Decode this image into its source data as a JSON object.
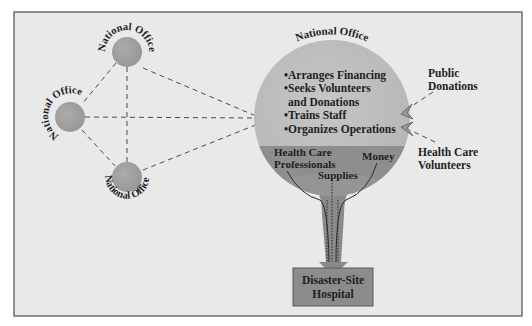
{
  "diagram": {
    "colors": {
      "background": "#e9e9e9",
      "frame": "#6e6e6e",
      "office_circle": "#a3a3a3",
      "central_circle": "#bdbdbd",
      "central_band": "#8e8e8e",
      "funnel": "#8a8a8a",
      "hospital_box": "#8c8c8c",
      "dash_line": "#4a4a4a",
      "text": "#1e1e1e"
    },
    "regional_offices": [
      {
        "label": "National Office",
        "position": "top"
      },
      {
        "label": "National Office",
        "position": "left"
      },
      {
        "label": "National Office",
        "position": "bottom"
      }
    ],
    "central_office": {
      "label": "National Office",
      "functions": [
        "•Arranges Financing",
        "•Seeks Volunteers",
        " and Donations",
        "•Trains Staff",
        "•Organizes Operations"
      ]
    },
    "resources": {
      "professionals_line1": "Health Care",
      "professionals_line2": "Professionals",
      "supplies": "Supplies",
      "money": "Money"
    },
    "inputs": {
      "public_donations_line1": "Public",
      "public_donations_line2": "Donations",
      "volunteers_line1": "Health Care",
      "volunteers_line2": "Volunteers"
    },
    "destination": {
      "line1": "Disaster-Site",
      "line2": "Hospital"
    }
  }
}
